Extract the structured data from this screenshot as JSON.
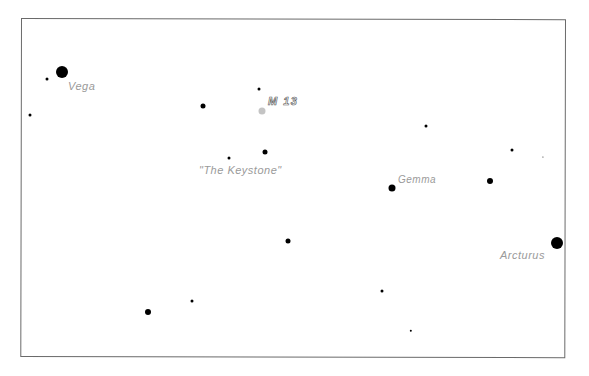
{
  "map": {
    "frame": {
      "left": 21,
      "top": 18,
      "width": 545,
      "height": 339,
      "color": "#6a6a6a"
    },
    "stars": [
      {
        "id": "vega",
        "x": 62,
        "y": 72,
        "r": 6
      },
      {
        "id": "s1",
        "x": 47,
        "y": 79,
        "r": 1.5
      },
      {
        "id": "s2",
        "x": 30,
        "y": 115,
        "r": 1.5
      },
      {
        "id": "s3",
        "x": 259,
        "y": 89,
        "r": 1.5
      },
      {
        "id": "s4",
        "x": 203,
        "y": 106,
        "r": 2.5
      },
      {
        "id": "m13",
        "x": 262,
        "y": 111,
        "r": 3.5,
        "type": "cluster",
        "color": "#c4c4c4"
      },
      {
        "id": "s5",
        "x": 265,
        "y": 152,
        "r": 2.5
      },
      {
        "id": "s6",
        "x": 229,
        "y": 158,
        "r": 1.5
      },
      {
        "id": "s7",
        "x": 426,
        "y": 126,
        "r": 1.5
      },
      {
        "id": "s8",
        "x": 512,
        "y": 150,
        "r": 1.5
      },
      {
        "id": "s9",
        "x": 543,
        "y": 157,
        "r": 0.6
      },
      {
        "id": "gemma",
        "x": 392,
        "y": 188,
        "r": 3.5
      },
      {
        "id": "s10",
        "x": 490,
        "y": 181,
        "r": 3
      },
      {
        "id": "s11",
        "x": 288,
        "y": 241,
        "r": 2.5
      },
      {
        "id": "arcturus",
        "x": 557,
        "y": 243,
        "r": 6
      },
      {
        "id": "s12",
        "x": 148,
        "y": 312,
        "r": 3
      },
      {
        "id": "s13",
        "x": 192,
        "y": 301,
        "r": 1.5
      },
      {
        "id": "s14",
        "x": 382,
        "y": 291,
        "r": 1.5
      },
      {
        "id": "s15",
        "x": 411,
        "y": 331,
        "r": 1.2
      }
    ],
    "labels": {
      "vega": {
        "text": "Vega",
        "x": 68,
        "y": 80,
        "size": 11
      },
      "m13": {
        "text": "M 13",
        "x": 268,
        "y": 95,
        "size": 11
      },
      "keystone": {
        "text": "\"The  Keystone\"",
        "x": 199,
        "y": 164,
        "size": 11
      },
      "gemma": {
        "text": "Gemma",
        "x": 398,
        "y": 174,
        "size": 10
      },
      "arcturus": {
        "text": "Arcturus",
        "x": 500,
        "y": 249,
        "size": 11
      }
    },
    "label_color": "#9a9a9a"
  }
}
